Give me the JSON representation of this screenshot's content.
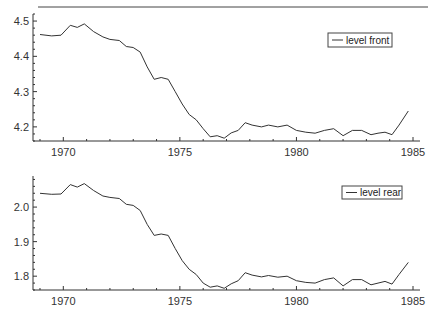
{
  "header": {
    "partial_text": "...",
    "rule": true
  },
  "chart_data": [
    {
      "type": "line",
      "title": "",
      "xlabel": "",
      "ylabel": "",
      "legend": [
        "level front"
      ],
      "legend_position": "upper right",
      "xlim": [
        1968.7,
        1985.3
      ],
      "ylim": [
        4.16,
        4.52
      ],
      "xticks": [
        1970,
        1975,
        1980,
        1985
      ],
      "yticks": [
        4.2,
        4.3,
        4.4,
        4.5
      ],
      "grid": false,
      "series": [
        {
          "name": "level front",
          "x": [
            1969.0,
            1969.5,
            1969.9,
            1970.3,
            1970.6,
            1970.9,
            1971.3,
            1971.7,
            1972.0,
            1972.4,
            1972.7,
            1973.0,
            1973.3,
            1973.6,
            1973.9,
            1974.2,
            1974.5,
            1974.8,
            1975.1,
            1975.4,
            1975.7,
            1976.0,
            1976.3,
            1976.6,
            1976.9,
            1977.2,
            1977.5,
            1977.8,
            1978.1,
            1978.5,
            1978.8,
            1979.2,
            1979.6,
            1980.0,
            1980.4,
            1980.8,
            1981.2,
            1981.6,
            1982.0,
            1982.4,
            1982.8,
            1983.2,
            1983.5,
            1983.8,
            1984.1,
            1984.4,
            1984.8
          ],
          "values": [
            4.462,
            4.458,
            4.46,
            4.488,
            4.482,
            4.492,
            4.47,
            4.455,
            4.448,
            4.445,
            4.428,
            4.425,
            4.412,
            4.37,
            4.335,
            4.34,
            4.335,
            4.3,
            4.265,
            4.235,
            4.22,
            4.195,
            4.172,
            4.175,
            4.168,
            4.183,
            4.19,
            4.212,
            4.205,
            4.2,
            4.205,
            4.2,
            4.205,
            4.19,
            4.185,
            4.182,
            4.19,
            4.195,
            4.175,
            4.19,
            4.19,
            4.178,
            4.182,
            4.185,
            4.178,
            4.205,
            4.245
          ]
        }
      ]
    },
    {
      "type": "line",
      "title": "",
      "xlabel": "",
      "ylabel": "",
      "legend": [
        "level rear"
      ],
      "legend_position": "upper right",
      "xlim": [
        1968.7,
        1985.3
      ],
      "ylim": [
        1.76,
        2.09
      ],
      "xticks": [
        1970,
        1975,
        1980,
        1985
      ],
      "yticks": [
        1.8,
        1.9,
        2.0
      ],
      "grid": false,
      "series": [
        {
          "name": "level rear",
          "x": [
            1969.0,
            1969.5,
            1969.9,
            1970.3,
            1970.6,
            1970.9,
            1971.3,
            1971.7,
            1972.0,
            1972.4,
            1972.7,
            1973.0,
            1973.3,
            1973.6,
            1973.9,
            1974.2,
            1974.5,
            1974.8,
            1975.1,
            1975.4,
            1975.7,
            1976.0,
            1976.3,
            1976.6,
            1976.9,
            1977.2,
            1977.5,
            1977.8,
            1978.1,
            1978.5,
            1978.8,
            1979.2,
            1979.6,
            1980.0,
            1980.4,
            1980.8,
            1981.2,
            1981.6,
            1982.0,
            1982.4,
            1982.8,
            1983.2,
            1983.5,
            1983.8,
            1984.1,
            1984.4,
            1984.8
          ],
          "values": [
            2.04,
            2.037,
            2.038,
            2.065,
            2.058,
            2.068,
            2.048,
            2.032,
            2.028,
            2.025,
            2.008,
            2.005,
            1.99,
            1.95,
            1.918,
            1.922,
            1.918,
            1.88,
            1.845,
            1.82,
            1.805,
            1.78,
            1.768,
            1.772,
            1.765,
            1.778,
            1.787,
            1.81,
            1.803,
            1.798,
            1.802,
            1.797,
            1.8,
            1.787,
            1.782,
            1.78,
            1.79,
            1.795,
            1.772,
            1.79,
            1.79,
            1.775,
            1.78,
            1.785,
            1.777,
            1.805,
            1.84
          ]
        }
      ]
    }
  ],
  "colors": {
    "line": "#333333",
    "axis": "#333333",
    "background": "#ffffff"
  }
}
